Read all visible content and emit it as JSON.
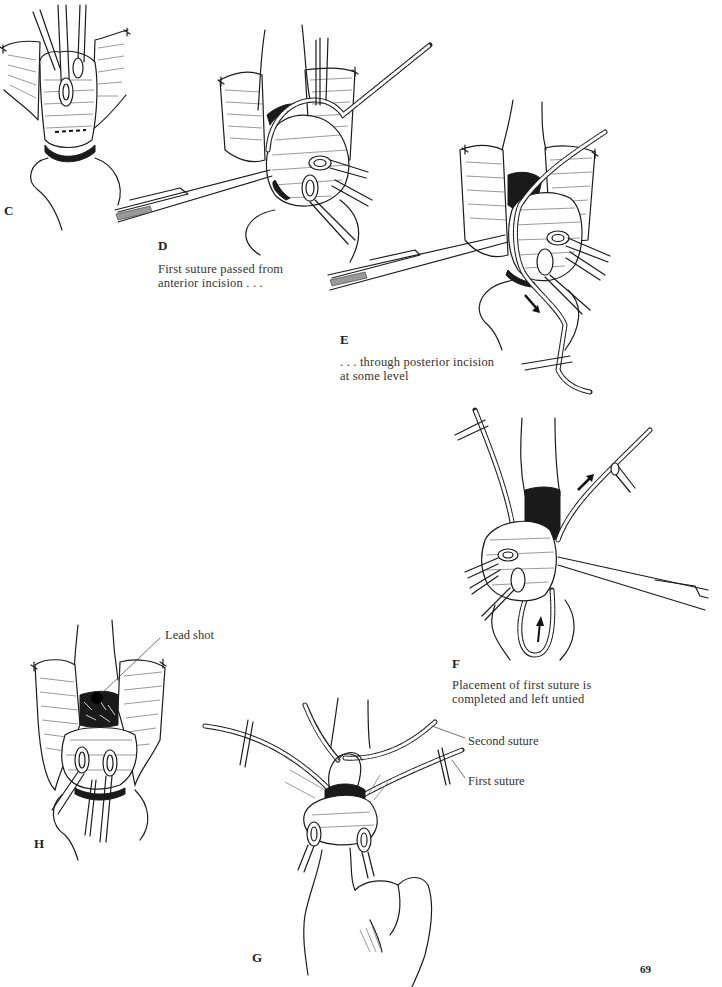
{
  "page": {
    "number": "69",
    "background": "#ffffff",
    "ink_color": "#1c1c1c"
  },
  "figures": {
    "C": {
      "label": "C",
      "caption_lines": []
    },
    "D": {
      "label": "D",
      "caption_lines": [
        "First suture passed from",
        "anterior incision . . ."
      ]
    },
    "E": {
      "label": "E",
      "caption_lines": [
        ". . . through posterior incision",
        "at some level"
      ]
    },
    "F": {
      "label": "F",
      "caption_lines": [
        "Placement of first suture is",
        "completed and left untied"
      ]
    },
    "G": {
      "label": "G",
      "callouts": [
        "Second suture",
        "First suture"
      ]
    },
    "H": {
      "label": "H",
      "callouts": [
        "Lead shot"
      ]
    }
  },
  "icons": {
    "clamp": "forceps-clamp-icon",
    "needle_holder": "needle-holder-icon",
    "suture": "suture-line-icon",
    "arrow": "direction-arrow-icon",
    "lead_shot": "lead-shot-icon"
  }
}
